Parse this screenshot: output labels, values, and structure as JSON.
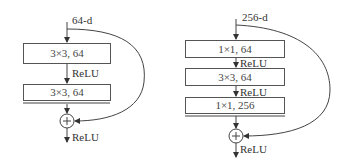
{
  "left_block": {
    "input_label": "64-d",
    "layers": [
      "3×3, 64",
      "3×3, 64"
    ],
    "activations": [
      "ReLU",
      "ReLU"
    ],
    "add_symbol": "+"
  },
  "right_block": {
    "input_label": "256-d",
    "layers": [
      "1×1, 64",
      "3×3, 64",
      "1×1, 256"
    ],
    "activations": [
      "ReLU",
      "ReLU",
      "ReLU"
    ],
    "add_symbol": "+"
  }
}
